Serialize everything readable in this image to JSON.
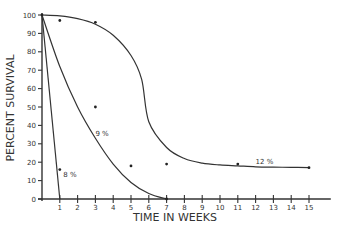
{
  "chart_data": {
    "type": "line",
    "title": "",
    "xlabel": "TIME IN WEEKS",
    "ylabel": "PERCENT SURVIVAL",
    "xlim": [
      0,
      16
    ],
    "ylim": [
      0,
      100
    ],
    "xticks": [
      1,
      2,
      3,
      4,
      5,
      6,
      7,
      8,
      9,
      10,
      11,
      12,
      13,
      14,
      15
    ],
    "yticks": [
      0,
      10,
      20,
      30,
      40,
      50,
      60,
      70,
      80,
      90,
      100
    ],
    "grid": false,
    "legend": "none",
    "series": [
      {
        "name": "8 %",
        "x": [
          0,
          1
        ],
        "y": [
          100,
          0
        ]
      },
      {
        "name": "9 %",
        "x": [
          0,
          1,
          2,
          3,
          4,
          5,
          6,
          7
        ],
        "y": [
          100,
          72,
          50,
          33,
          19,
          9,
          3,
          0
        ]
      },
      {
        "name": "12 %",
        "x": [
          0,
          1,
          2,
          3,
          4,
          5,
          5.6,
          6,
          7,
          8,
          9,
          10,
          11,
          12,
          13,
          14,
          15
        ],
        "y": [
          100,
          99.5,
          98,
          95,
          89,
          78,
          65,
          42,
          28,
          22,
          19.5,
          18.5,
          18,
          17.5,
          17.3,
          17.2,
          17
        ]
      }
    ],
    "points": [
      {
        "x": 0,
        "y": 100
      },
      {
        "x": 1,
        "y": 97
      },
      {
        "x": 3,
        "y": 96
      },
      {
        "x": 3,
        "y": 50
      },
      {
        "x": 1,
        "y": 16
      },
      {
        "x": 5,
        "y": 18
      },
      {
        "x": 7,
        "y": 19
      },
      {
        "x": 11,
        "y": 19
      },
      {
        "x": 15,
        "y": 17
      },
      {
        "x": 7,
        "y": 0
      }
    ],
    "annotations": [
      {
        "text": "8 %",
        "x": 1.2,
        "y": 12
      },
      {
        "text": "9 %",
        "x": 3,
        "y": 34
      },
      {
        "text": "12 %",
        "x": 12,
        "y": 19
      }
    ]
  }
}
